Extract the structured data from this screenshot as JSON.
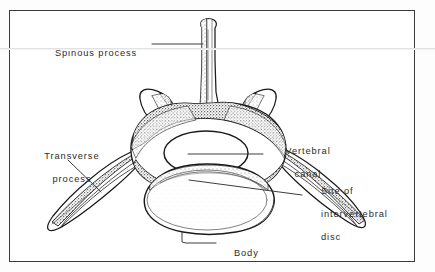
{
  "figure": {
    "background_color": "#ffffff",
    "frame_color": "#3b3b3b",
    "ink_color": "#1a1a1a",
    "text_color": "#2b2b2b"
  },
  "labels": {
    "spinous_process": {
      "text": "Spinous process",
      "lines": [
        "Spinous process"
      ]
    },
    "transverse_process": {
      "text": "Transverse process",
      "lines": [
        "Transverse",
        "process"
      ]
    },
    "vertebral_canal": {
      "text": "Vertebral canal",
      "lines": [
        "Vertebral",
        "canal"
      ]
    },
    "intervertebral_disc": {
      "text": "Site of intervertebral disc",
      "lines": [
        "Site of",
        "intervertebral",
        "disc"
      ]
    },
    "body": {
      "text": "Body",
      "lines": [
        "Body"
      ]
    }
  }
}
